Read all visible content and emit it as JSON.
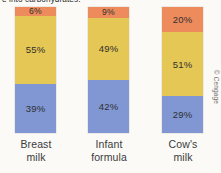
{
  "figure": {
    "caption_partial": "e into carbohydrates.",
    "credit": "© Cengage"
  },
  "chart_data": {
    "type": "bar",
    "subtype": "100% stacked column",
    "title": "",
    "subtitle": "",
    "xlabel": "",
    "ylabel": "",
    "ylim": [
      0,
      100
    ],
    "grid": false,
    "legend_position": "none",
    "unit": "%",
    "categories": [
      "Breast milk",
      "Infant formula",
      "Cow's milk"
    ],
    "category_lines": [
      [
        "Breast",
        "milk"
      ],
      [
        "Infant",
        "formula"
      ],
      [
        "Cow's",
        "milk"
      ]
    ],
    "series": [
      {
        "name": "Protein",
        "color": "#ee8b5c",
        "values": [
          6,
          9,
          20
        ]
      },
      {
        "name": "Carbohydrate",
        "color": "#e4c754",
        "values": [
          55,
          49,
          51
        ]
      },
      {
        "name": "Fat",
        "color": "#8097d3",
        "values": [
          39,
          42,
          29
        ]
      }
    ],
    "bars": [
      {
        "category": "Breast milk",
        "segments": [
          {
            "label": "6%",
            "value": 6,
            "color": "#ee8b5c"
          },
          {
            "label": "55%",
            "value": 55,
            "color": "#e4c754"
          },
          {
            "label": "39%",
            "value": 39,
            "color": "#8097d3"
          }
        ]
      },
      {
        "category": "Infant formula",
        "segments": [
          {
            "label": "9%",
            "value": 9,
            "color": "#ee8b5c"
          },
          {
            "label": "49%",
            "value": 49,
            "color": "#e4c754"
          },
          {
            "label": "42%",
            "value": 42,
            "color": "#8097d3"
          }
        ]
      },
      {
        "category": "Cow's milk",
        "segments": [
          {
            "label": "20%",
            "value": 20,
            "color": "#ee8b5c"
          },
          {
            "label": "51%",
            "value": 51,
            "color": "#e4c754"
          },
          {
            "label": "29%",
            "value": 29,
            "color": "#8097d3"
          }
        ]
      }
    ],
    "colors": {
      "orange": "#ee8b5c",
      "yellow": "#e4c754",
      "blue": "#8097d3",
      "background": "#fbfaf7"
    }
  }
}
